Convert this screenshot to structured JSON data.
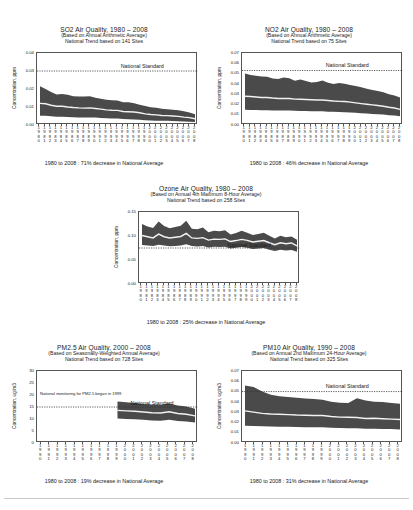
{
  "page": {
    "background": "#ffffff",
    "band_color": "#4a4a4a",
    "median_color": "#f2f2f2",
    "axis_color": "#555555"
  },
  "charts": [
    {
      "id": "so2",
      "title": "SO2 Air Quality, 1980 – 2008",
      "subtitle1": "(Based on Annual Arithmetic Average)",
      "subtitle2": "National Trend based on 141 Sites",
      "ylabel": "Concentration, ppm",
      "footer": "1980 to 2008 : 71% decrease in National Average",
      "standard_label": "National Standard",
      "standard_value": 0.03,
      "ylim": [
        0,
        0.04
      ],
      "yticks": [
        "0.00",
        "0.01",
        "0.02",
        "0.03",
        "0.04"
      ],
      "ytick_values": [
        0,
        0.01,
        0.02,
        0.03,
        0.04
      ],
      "years": [
        1980,
        1981,
        1982,
        1983,
        1984,
        1985,
        1986,
        1987,
        1988,
        1989,
        1990,
        1991,
        1992,
        1993,
        1994,
        1995,
        1996,
        1997,
        1998,
        1999,
        2000,
        2001,
        2002,
        2003,
        2004,
        2005,
        2006,
        2007,
        2008
      ],
      "median": [
        0.012,
        0.0118,
        0.011,
        0.0104,
        0.0104,
        0.01,
        0.0097,
        0.0095,
        0.0094,
        0.0095,
        0.0092,
        0.0088,
        0.0084,
        0.0082,
        0.0081,
        0.0075,
        0.0074,
        0.0072,
        0.0068,
        0.0062,
        0.0058,
        0.0056,
        0.0053,
        0.0052,
        0.005,
        0.0048,
        0.0044,
        0.0041,
        0.0035
      ],
      "upper": [
        0.0215,
        0.02,
        0.0183,
        0.017,
        0.0172,
        0.0168,
        0.016,
        0.0158,
        0.0159,
        0.016,
        0.0152,
        0.0146,
        0.014,
        0.0138,
        0.0136,
        0.0126,
        0.0126,
        0.0121,
        0.0113,
        0.0105,
        0.0098,
        0.0096,
        0.009,
        0.0088,
        0.0085,
        0.0082,
        0.0076,
        0.007,
        0.006
      ],
      "lower": [
        0.0052,
        0.0051,
        0.0048,
        0.0046,
        0.0046,
        0.0044,
        0.0043,
        0.0042,
        0.0042,
        0.0042,
        0.0041,
        0.0039,
        0.0037,
        0.0036,
        0.0036,
        0.0033,
        0.0032,
        0.0031,
        0.0029,
        0.0027,
        0.0025,
        0.0024,
        0.0023,
        0.0023,
        0.0022,
        0.0021,
        0.0019,
        0.0018,
        0.0016
      ]
    },
    {
      "id": "no2",
      "title": "NO2 Air Quality, 1980 – 2008",
      "subtitle1": "(Based on Annual Arithmetic Average)",
      "subtitle2": "National Trend based on 75 Sites",
      "ylabel": "Concentration, ppm",
      "footer": "1980 to 2008 : 46% decrease in National Average",
      "standard_label": "National Standard",
      "standard_value": 0.053,
      "ylim": [
        0,
        0.07
      ],
      "yticks": [
        "0.00",
        "0.01",
        "0.02",
        "0.03",
        "0.04",
        "0.05",
        "0.06",
        "0.07"
      ],
      "ytick_values": [
        0,
        0.01,
        0.02,
        0.03,
        0.04,
        0.05,
        0.06,
        0.07
      ],
      "years": [
        1980,
        1981,
        1982,
        1983,
        1984,
        1985,
        1986,
        1987,
        1988,
        1989,
        1990,
        1991,
        1992,
        1993,
        1994,
        1995,
        1996,
        1997,
        1998,
        1999,
        2000,
        2001,
        2002,
        2003,
        2004,
        2005,
        2006,
        2007,
        2008
      ],
      "median": [
        0.028,
        0.0277,
        0.0272,
        0.0268,
        0.0268,
        0.0262,
        0.0258,
        0.0258,
        0.0258,
        0.0252,
        0.025,
        0.0248,
        0.0245,
        0.0243,
        0.0243,
        0.0238,
        0.0233,
        0.023,
        0.0228,
        0.0222,
        0.0215,
        0.0208,
        0.0202,
        0.0196,
        0.019,
        0.0182,
        0.0172,
        0.0165,
        0.0152
      ],
      "upper": [
        0.05,
        0.0486,
        0.0478,
        0.0472,
        0.047,
        0.0452,
        0.0448,
        0.0462,
        0.0455,
        0.043,
        0.0442,
        0.0428,
        0.0412,
        0.0418,
        0.0432,
        0.041,
        0.0398,
        0.0408,
        0.04,
        0.0388,
        0.038,
        0.0368,
        0.0352,
        0.034,
        0.033,
        0.0318,
        0.03,
        0.0288,
        0.0268
      ],
      "lower": [
        0.0148,
        0.0146,
        0.0145,
        0.0143,
        0.0143,
        0.0141,
        0.014,
        0.014,
        0.014,
        0.0138,
        0.0137,
        0.0136,
        0.0134,
        0.0133,
        0.0133,
        0.013,
        0.0128,
        0.0126,
        0.0125,
        0.0122,
        0.0118,
        0.0114,
        0.0112,
        0.0108,
        0.0105,
        0.0101,
        0.0096,
        0.0092,
        0.0086
      ]
    },
    {
      "id": "ozone",
      "title": "Ozone Air Quality, 1980 – 2008",
      "subtitle1": "(Based on Annual 4th Maximum 8-Hour Average)",
      "subtitle2": "National Trend based on 258 Sites",
      "ylabel": "Concentration, ppm",
      "footer": "1980 to 2008 : 25% decrease in National Average",
      "standard_label": "National Standard",
      "standard_value": 0.075,
      "ylim": [
        0,
        0.15
      ],
      "yticks": [
        "0.00",
        "0.05",
        "0.10",
        "0.15"
      ],
      "ytick_values": [
        0,
        0.05,
        0.1,
        0.15
      ],
      "years": [
        1980,
        1981,
        1982,
        1983,
        1984,
        1985,
        1986,
        1987,
        1988,
        1989,
        1990,
        1991,
        1992,
        1993,
        1994,
        1995,
        1996,
        1997,
        1998,
        1999,
        2000,
        2001,
        2002,
        2003,
        2004,
        2005,
        2006,
        2007,
        2008
      ],
      "median": [
        0.101,
        0.0985,
        0.096,
        0.104,
        0.0985,
        0.096,
        0.0975,
        0.099,
        0.1055,
        0.096,
        0.095,
        0.0965,
        0.0915,
        0.0935,
        0.093,
        0.094,
        0.0885,
        0.0905,
        0.093,
        0.091,
        0.0875,
        0.089,
        0.0905,
        0.086,
        0.082,
        0.086,
        0.084,
        0.0855,
        0.0795
      ],
      "upper": [
        0.125,
        0.12,
        0.1165,
        0.13,
        0.121,
        0.116,
        0.119,
        0.1215,
        0.132,
        0.115,
        0.114,
        0.1175,
        0.108,
        0.111,
        0.11,
        0.112,
        0.103,
        0.106,
        0.111,
        0.107,
        0.102,
        0.104,
        0.107,
        0.1005,
        0.095,
        0.1005,
        0.0975,
        0.099,
        0.092
      ],
      "lower": [
        0.081,
        0.08,
        0.079,
        0.082,
        0.08,
        0.0785,
        0.079,
        0.08,
        0.083,
        0.079,
        0.078,
        0.079,
        0.076,
        0.0775,
        0.077,
        0.0775,
        0.074,
        0.0755,
        0.077,
        0.0755,
        0.073,
        0.074,
        0.075,
        0.0715,
        0.069,
        0.0715,
        0.07,
        0.071,
        0.067
      ]
    },
    {
      "id": "pm25",
      "title": "PM2.5 Air Quality, 2000 – 2008",
      "subtitle1": "(Based on Seasonally-Weighted Annual Average)",
      "subtitle2": "National Trend based on 728 Sites",
      "ylabel": "Concentration, ug/m3",
      "footer": "1980 to 2008 : 19% decrease in National Average",
      "standard_label": "National Standard",
      "standard_value": 15,
      "annotation": "National monitoring for PM2.5 began in 1999",
      "ylim": [
        0,
        30
      ],
      "yticks": [
        "0",
        "5",
        "10",
        "15",
        "20",
        "25",
        "30"
      ],
      "ytick_values": [
        0,
        5,
        10,
        15,
        20,
        25,
        30
      ],
      "years": [
        1990,
        1991,
        1992,
        1993,
        1994,
        1995,
        1996,
        1997,
        1998,
        1999,
        2000,
        2001,
        2002,
        2003,
        2004,
        2005,
        2006,
        2007,
        2008
      ],
      "data_start_year": 1999,
      "median": [
        null,
        null,
        null,
        null,
        null,
        null,
        null,
        null,
        null,
        13.6,
        13.4,
        13.2,
        12.9,
        12.6,
        12.5,
        13.0,
        12.3,
        12.0,
        11.3
      ],
      "upper": [
        null,
        null,
        null,
        null,
        null,
        null,
        null,
        null,
        null,
        17.3,
        17.0,
        16.7,
        16.3,
        16.0,
        15.9,
        16.5,
        15.6,
        15.2,
        14.3
      ],
      "lower": [
        null,
        null,
        null,
        null,
        null,
        null,
        null,
        null,
        null,
        10.2,
        10.0,
        9.9,
        9.7,
        9.4,
        9.3,
        9.7,
        9.2,
        9.0,
        8.5
      ]
    },
    {
      "id": "pm10",
      "title": "PM10 Air Quality, 1990 – 2008",
      "subtitle1": "(Based on Annual 2nd Maximum 24-Hour Average)",
      "subtitle2": "National Trend based on 325 Sites",
      "ylabel": "Concentration, ug/m3",
      "footer": "1980 to 2008 : 31% decrease in National Average",
      "standard_label": "National Standard",
      "standard_value": 0.05,
      "ylim": [
        0,
        0.07
      ],
      "yticks": [
        "0.00",
        "0.01",
        "0.02",
        "0.03",
        "0.04",
        "0.05",
        "0.06",
        "0.07"
      ],
      "ytick_values": [
        0,
        0.01,
        0.02,
        0.03,
        0.04,
        0.05,
        0.06,
        0.07
      ],
      "years": [
        1990,
        1991,
        1992,
        1993,
        1994,
        1995,
        1996,
        1997,
        1998,
        1999,
        2000,
        2001,
        2002,
        2003,
        2004,
        2005,
        2006,
        2007,
        2008
      ],
      "median": [
        0.0312,
        0.03,
        0.0288,
        0.0282,
        0.028,
        0.0276,
        0.0272,
        0.027,
        0.0268,
        0.0268,
        0.0258,
        0.0252,
        0.025,
        0.0248,
        0.0238,
        0.024,
        0.0236,
        0.0232,
        0.0228
      ],
      "upper": [
        0.056,
        0.0545,
        0.05,
        0.047,
        0.0455,
        0.0448,
        0.044,
        0.0432,
        0.0428,
        0.042,
        0.0402,
        0.0392,
        0.0388,
        0.0436,
        0.0412,
        0.04,
        0.0398,
        0.039,
        0.0382
      ],
      "lower": [
        0.0168,
        0.0166,
        0.0162,
        0.016,
        0.0158,
        0.0157,
        0.0155,
        0.0154,
        0.0152,
        0.0152,
        0.0148,
        0.0145,
        0.0144,
        0.0143,
        0.0138,
        0.0139,
        0.0137,
        0.0135,
        0.0132
      ]
    }
  ]
}
